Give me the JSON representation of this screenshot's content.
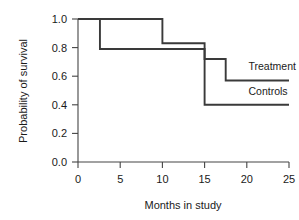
{
  "chart_data": {
    "type": "line",
    "subtype": "kaplan-meier-step",
    "title": "",
    "xlabel": "Months in study",
    "ylabel": "Probability of survival",
    "xlim": [
      0,
      25
    ],
    "ylim": [
      0.0,
      1.0
    ],
    "xticks": [
      0,
      5,
      10,
      15,
      20,
      25
    ],
    "xtick_labels": [
      "0",
      "5",
      "10",
      "15",
      "20",
      "25"
    ],
    "yticks": [
      0.0,
      0.2,
      0.4,
      0.6,
      0.8,
      1.0
    ],
    "ytick_labels": [
      "0.0",
      "0.2",
      "0.4",
      "0.6",
      "0.8",
      "1.0"
    ],
    "grid": false,
    "legend_position": "inline-right",
    "line_color": "#3a3a3a",
    "axis_color": "#444444",
    "series": [
      {
        "name": "Treatment",
        "label": "Treatment",
        "label_x": 20.2,
        "label_y": 0.64,
        "x": [
          0,
          10,
          10,
          15,
          15,
          17.5,
          17.5,
          25
        ],
        "y": [
          1.0,
          1.0,
          0.83,
          0.83,
          0.72,
          0.72,
          0.57,
          0.57
        ],
        "steps": [
          {
            "from_month": 0,
            "to_month": 10,
            "survival": 1.0
          },
          {
            "from_month": 10,
            "to_month": 15,
            "survival": 0.83
          },
          {
            "from_month": 15,
            "to_month": 17.5,
            "survival": 0.72
          },
          {
            "from_month": 17.5,
            "to_month": 25,
            "survival": 0.57
          }
        ]
      },
      {
        "name": "Controls",
        "label": "Controls",
        "label_x": 20.2,
        "label_y": 0.47,
        "x": [
          0,
          2.6,
          2.6,
          15,
          15,
          25
        ],
        "y": [
          1.0,
          1.0,
          0.79,
          0.79,
          0.4,
          0.4
        ],
        "steps": [
          {
            "from_month": 0,
            "to_month": 2.6,
            "survival": 1.0
          },
          {
            "from_month": 2.6,
            "to_month": 15,
            "survival": 0.79
          },
          {
            "from_month": 15,
            "to_month": 25,
            "survival": 0.4
          }
        ]
      }
    ]
  }
}
